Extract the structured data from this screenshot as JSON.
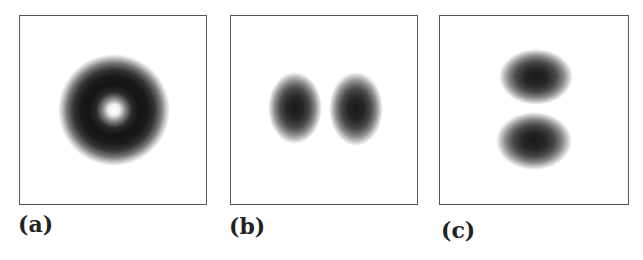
{
  "figure": {
    "panels": [
      {
        "id": "a",
        "label": "(a)",
        "description": "Donut-shaped intensity pattern: dark ring with bright center",
        "shape": "ring"
      },
      {
        "id": "b",
        "label": "(b)",
        "description": "Two vertically elongated dark lobes side by side (horizontal pair)",
        "shape": "two-lobes-horizontal"
      },
      {
        "id": "c",
        "label": "(c)",
        "description": "Two horizontally elongated dark lobes stacked vertically",
        "shape": "two-lobes-vertical"
      }
    ],
    "colors": {
      "background": "#ffffff",
      "frame": "#555555",
      "intensity_dark": "#111111"
    }
  }
}
